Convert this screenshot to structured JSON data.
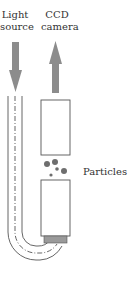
{
  "labels": {
    "light_source": [
      "Light",
      "source"
    ],
    "ccd_camera": [
      "CCD",
      "camera"
    ],
    "particles": "Particles"
  },
  "arrows": [
    {
      "name": "light-source-arrow",
      "direction": "down",
      "color": "#8c8c8c"
    },
    {
      "name": "ccd-camera-arrow",
      "direction": "up",
      "color": "#8c8c8c"
    }
  ],
  "colors": {
    "stroke": "#555555",
    "arrow": "#8c8c8c",
    "cap": "#9a9a9a",
    "particle": "#6e6e6e"
  }
}
